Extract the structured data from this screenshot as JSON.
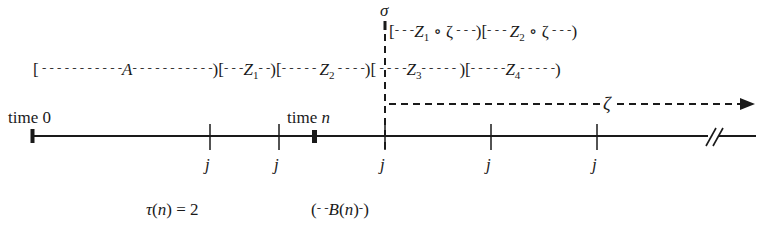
{
  "diagram": {
    "axis": {
      "start_label": "time 0",
      "marker_label": "time",
      "marker_var": "n",
      "tick_label": "j",
      "tick_count": 5
    },
    "stopping_time": {
      "symbol": "σ"
    },
    "row_upper": {
      "segments": [
        {
          "name": "Z",
          "sub": "1",
          "suffix": " ∘ ζ"
        },
        {
          "name": "Z",
          "sub": "2",
          "suffix": " ∘ ζ"
        }
      ]
    },
    "row_lower": {
      "segments": [
        {
          "name": "A",
          "sub": ""
        },
        {
          "name": "Z",
          "sub": "1"
        },
        {
          "name": "Z",
          "sub": "2"
        },
        {
          "name": "Z",
          "sub": "3"
        },
        {
          "name": "Z",
          "sub": "4"
        }
      ]
    },
    "shift_arrow": {
      "label": "ζ"
    },
    "annotations": {
      "tau": "τ(n) = 2",
      "tau_fn": "τ",
      "tau_arg": "n",
      "tau_value": "= 2",
      "block": "B(n)",
      "block_fn": "B",
      "block_arg": "n"
    }
  }
}
